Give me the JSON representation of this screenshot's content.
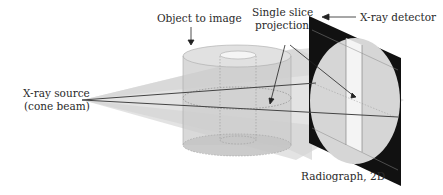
{
  "diagram": {
    "type": "cone-beam X-ray imaging schematic",
    "labels": {
      "object": "Object to image",
      "slice_line1": "Single slice",
      "slice_line2": "projection",
      "detector": "X-ray detector",
      "source_line1": "X-ray source",
      "source_line2": "(cone beam)",
      "radiograph": "Radiograph, 2D"
    },
    "colors": {
      "beam": "#d9d9d9",
      "cylinder": "#cfcfcf",
      "detector": "#111111",
      "radiograph_circle": "#d6d6d6",
      "radiograph_stripe": "#f4f4f4",
      "lines": "#444444"
    }
  }
}
